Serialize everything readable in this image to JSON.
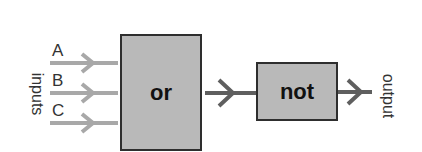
{
  "diagram": {
    "inputs_label": "inputs",
    "output_label": "output",
    "inputs": [
      {
        "label": "A"
      },
      {
        "label": "B"
      },
      {
        "label": "C"
      }
    ],
    "gates": [
      {
        "id": "or",
        "label": "or"
      },
      {
        "id": "not",
        "label": "not"
      }
    ],
    "colors": {
      "gate_fill": "#b9b9b9",
      "gate_border": "#2e2e2e",
      "input_arrow": "#a8a8a8",
      "connector_arrow": "#5f5f5f"
    }
  }
}
